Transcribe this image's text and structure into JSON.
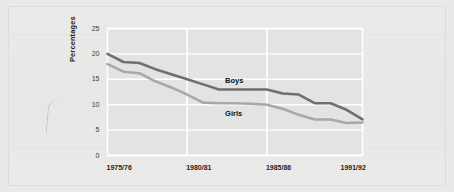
{
  "figure": {
    "background_color": "#e9e9e7",
    "plot_background_color": "#e3e3e1",
    "gridline_color": "#ffffff",
    "frame_border_color": "#dcdcda"
  },
  "axis": {
    "y_title": "Percentages",
    "y_ticks": [
      "0",
      "5",
      "10",
      "15",
      "20",
      "25"
    ],
    "x_ticks": [
      "1975/76",
      "1980/81",
      "1985/86",
      "1991/92"
    ]
  },
  "series_labels": {
    "boys": "Boys",
    "girls": "Girls"
  },
  "chart_data": {
    "type": "line",
    "title": "",
    "xlabel": "",
    "ylabel": "Percentages",
    "ylim": [
      0,
      25
    ],
    "y_ticks": [
      0,
      5,
      10,
      15,
      20,
      25
    ],
    "grid": true,
    "legend_position": "inline-labels",
    "x": [
      "1975/76",
      "1976/77",
      "1977/78",
      "1978/79",
      "1979/80",
      "1980/81",
      "1981/82",
      "1982/83",
      "1983/84",
      "1984/85",
      "1985/86",
      "1986/87",
      "1987/88",
      "1988/89",
      "1989/90",
      "1990/91",
      "1991/92"
    ],
    "x_tick_labels": [
      "1975/76",
      "1980/81",
      "1985/86",
      "1991/92"
    ],
    "x_tick_indices": [
      0,
      5,
      10,
      16
    ],
    "series": [
      {
        "name": "Boys",
        "color": "#6f6f6f",
        "values": [
          20.0,
          18.4,
          18.2,
          17.0,
          16.0,
          15.0,
          14.0,
          13.0,
          13.0,
          13.0,
          13.0,
          12.2,
          12.0,
          10.3,
          10.3,
          9.0,
          7.1
        ]
      },
      {
        "name": "Girls",
        "color": "#a8a8a8",
        "values": [
          18.0,
          16.5,
          16.2,
          14.6,
          13.4,
          12.0,
          10.4,
          10.3,
          10.3,
          10.2,
          10.0,
          9.2,
          8.0,
          7.1,
          7.1,
          6.4,
          6.5
        ]
      }
    ]
  }
}
